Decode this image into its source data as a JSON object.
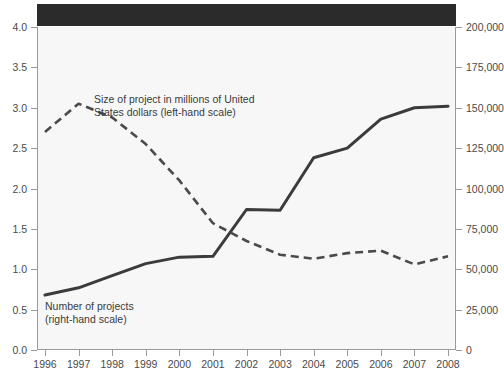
{
  "chart_data": {
    "type": "line",
    "title": "",
    "xlabel": "",
    "ylabel": "",
    "x": [
      "1996",
      "1997",
      "1998",
      "1999",
      "2000",
      "2001",
      "2002",
      "2003",
      "2004",
      "2005",
      "2006",
      "2007",
      "2008"
    ],
    "grid": false,
    "legend_position": "inline-annotations",
    "axes": {
      "left": {
        "label": "Size of project in millions of United States dollars",
        "ticks": [
          "0.0",
          "0.5",
          "1.0",
          "1.5",
          "2.0",
          "2.5",
          "3.0",
          "3.5",
          "4.0"
        ],
        "tick_values": [
          0.0,
          0.5,
          1.0,
          1.5,
          2.0,
          2.5,
          3.0,
          3.5,
          4.0
        ],
        "ylim": [
          0.0,
          4.0
        ]
      },
      "right": {
        "label": "Number of projects",
        "ticks": [
          "0",
          "25,000",
          "50,000",
          "75,000",
          "100,000",
          "125,000",
          "150,000",
          "175,000",
          "200,000"
        ],
        "tick_values": [
          0,
          25000,
          50000,
          75000,
          100000,
          125000,
          150000,
          175000,
          200000
        ],
        "ylim": [
          0,
          200000
        ]
      }
    },
    "series": [
      {
        "name": "Size of project in millions of United States dollars (left-hand scale)",
        "axis": "left",
        "style": "dashed",
        "color": "#4a4a4a",
        "values": [
          2.7,
          3.05,
          2.88,
          2.55,
          2.1,
          1.57,
          1.35,
          1.18,
          1.13,
          1.2,
          1.23,
          1.06,
          1.16
        ]
      },
      {
        "name": "Number of projects (right-hand scale)",
        "axis": "right",
        "style": "solid",
        "color": "#3b3b3b",
        "values": [
          34000,
          38500,
          46000,
          53500,
          57500,
          58000,
          87000,
          86500,
          119000,
          125000,
          143000,
          150000,
          151000
        ]
      }
    ],
    "annotations": [
      {
        "id": "size-annotation",
        "text": "Size of project in millions of United\nStates dollars (left-hand scale)"
      },
      {
        "id": "count-annotation",
        "text": "Number of projects\n(right-hand scale)"
      }
    ]
  },
  "colors": {
    "plot_background": "#f7f7f7",
    "axis": "#9a9a9a",
    "solid_series": "#3b3b3b",
    "dashed_series": "#4a4a4a",
    "title_band": "#2b2b2b"
  }
}
